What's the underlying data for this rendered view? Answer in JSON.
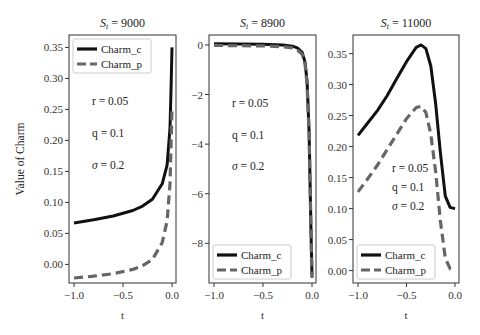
{
  "figure": {
    "ylabel": "Value of Charm",
    "xlabel": "t"
  },
  "chart_data": [
    {
      "type": "line",
      "title": "S_t = 9000",
      "title_main": "S",
      "title_sub": "t",
      "title_rest": " = 9000",
      "xlabel": "t",
      "ylabel": "Value of Charm",
      "xlim": [
        -1.0,
        0.0
      ],
      "ylim": [
        -0.03,
        0.37
      ],
      "xticks": [
        "-1.0",
        "-0.5",
        "0.0"
      ],
      "yticks": [
        "0.35",
        "0.30",
        "0.25",
        "0.20",
        "0.15",
        "0.10",
        "0.05",
        "0.00"
      ],
      "legend_position": "upper left",
      "annotations": [
        "r = 0.05",
        "q = 0.1",
        "σ = 0.2"
      ],
      "series": [
        {
          "name": "Charm_c",
          "style": "solid",
          "color": "#111111",
          "x": [
            -1.0,
            -0.8,
            -0.6,
            -0.4,
            -0.3,
            -0.2,
            -0.1,
            -0.05,
            -0.02,
            -0.01,
            0.0
          ],
          "values": [
            0.067,
            0.072,
            0.078,
            0.087,
            0.094,
            0.105,
            0.13,
            0.16,
            0.22,
            0.28,
            0.35
          ]
        },
        {
          "name": "Charm_p",
          "style": "dashed",
          "color": "#666666",
          "x": [
            -1.0,
            -0.8,
            -0.6,
            -0.4,
            -0.3,
            -0.2,
            -0.1,
            -0.05,
            -0.02,
            -0.01,
            0.0
          ],
          "values": [
            -0.022,
            -0.019,
            -0.015,
            -0.008,
            -0.002,
            0.008,
            0.035,
            0.07,
            0.13,
            0.19,
            0.25
          ]
        }
      ]
    },
    {
      "type": "line",
      "title": "S_t = 8900",
      "title_main": "S",
      "title_sub": "t",
      "title_rest": " = 8900",
      "xlabel": "t",
      "xlim": [
        -1.0,
        0.0
      ],
      "ylim": [
        -9.6,
        0.4
      ],
      "xticks": [
        "-1.0",
        "-0.5",
        "0.0"
      ],
      "yticks": [
        "0",
        "-2",
        "-4",
        "-6",
        "-8"
      ],
      "legend_position": "lower left",
      "annotations": [
        "r = 0.05",
        "q = 0.1",
        "σ = 0.2"
      ],
      "series": [
        {
          "name": "Charm_c",
          "style": "solid",
          "color": "#111111",
          "x": [
            -1.0,
            -0.5,
            -0.3,
            -0.2,
            -0.15,
            -0.1,
            -0.07,
            -0.05,
            -0.03,
            -0.01,
            0.0
          ],
          "values": [
            0.05,
            0.03,
            0.0,
            -0.05,
            -0.12,
            -0.3,
            -0.7,
            -1.5,
            -3.5,
            -7.5,
            -9.3
          ]
        },
        {
          "name": "Charm_p",
          "style": "dashed",
          "color": "#666666",
          "x": [
            -1.0,
            -0.5,
            -0.3,
            -0.2,
            -0.15,
            -0.1,
            -0.07,
            -0.05,
            -0.03,
            -0.01,
            0.0
          ],
          "values": [
            -0.02,
            -0.04,
            -0.07,
            -0.12,
            -0.2,
            -0.38,
            -0.78,
            -1.6,
            -3.6,
            -7.6,
            -9.4
          ]
        }
      ]
    },
    {
      "type": "line",
      "title": "S_t = 11000",
      "title_main": "S",
      "title_sub": "t",
      "title_rest": " = 11000",
      "xlabel": "t",
      "xlim": [
        -1.0,
        0.0
      ],
      "ylim": [
        -0.02,
        0.38
      ],
      "xticks": [
        "-1.0",
        "-0.5",
        "0.0"
      ],
      "yticks": [
        "0.35",
        "0.30",
        "0.25",
        "0.20",
        "0.15",
        "0.10",
        "0.05",
        "0.00"
      ],
      "legend_position": "lower left",
      "annotations": [
        "r = 0.05",
        "q = 0.1",
        "σ = 0.2"
      ],
      "series": [
        {
          "name": "Charm_c",
          "style": "solid",
          "color": "#111111",
          "x": [
            -1.0,
            -0.9,
            -0.8,
            -0.7,
            -0.6,
            -0.5,
            -0.4,
            -0.35,
            -0.3,
            -0.25,
            -0.2,
            -0.15,
            -0.1,
            -0.05,
            0.0
          ],
          "values": [
            0.218,
            0.238,
            0.258,
            0.282,
            0.31,
            0.337,
            0.36,
            0.364,
            0.358,
            0.33,
            0.27,
            0.19,
            0.12,
            0.102,
            0.1
          ]
        },
        {
          "name": "Charm_p",
          "style": "dashed",
          "color": "#666666",
          "x": [
            -1.0,
            -0.9,
            -0.8,
            -0.7,
            -0.6,
            -0.5,
            -0.4,
            -0.35,
            -0.3,
            -0.25,
            -0.2,
            -0.15,
            -0.1,
            -0.05,
            0.0
          ],
          "values": [
            0.127,
            0.148,
            0.17,
            0.195,
            0.22,
            0.245,
            0.263,
            0.265,
            0.255,
            0.22,
            0.16,
            0.08,
            0.02,
            0.003,
            0.0
          ]
        }
      ]
    }
  ]
}
